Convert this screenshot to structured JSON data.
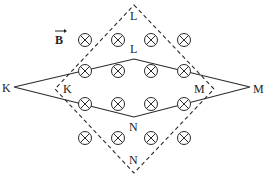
{
  "diagram": {
    "type": "physics-magnetic-field-loops",
    "field_label": "B",
    "field_direction": "into-page",
    "field_symbol": "⊗",
    "colors": {
      "line": "#2a2a2a",
      "background": "#ffffff"
    },
    "dashed_square": {
      "vertices": {
        "top": {
          "label": "L",
          "x": 134,
          "y": 5
        },
        "left": {
          "label": "K",
          "x": 55,
          "y": 89
        },
        "right": {
          "label": "M",
          "x": 214,
          "y": 89
        },
        "bottom": {
          "label": "N",
          "x": 134,
          "y": 173
        }
      }
    },
    "solid_rhombus": {
      "vertices": {
        "left": {
          "label": "K",
          "x": 14,
          "y": 87
        },
        "top": {
          "label": "L",
          "x": 134,
          "y": 59
        },
        "right": {
          "label": "M",
          "x": 250,
          "y": 87
        },
        "bottom": {
          "label": "N",
          "x": 134,
          "y": 117
        }
      }
    },
    "labels": {
      "outer_top": "L",
      "inner_top": "L",
      "outer_left": "K",
      "inner_left": "K",
      "outer_right": "M",
      "inner_right": "M",
      "inner_bottom": "N",
      "outer_bottom": "N",
      "field": "B"
    },
    "field_markers": [
      {
        "x": 85,
        "y": 40
      },
      {
        "x": 118,
        "y": 40
      },
      {
        "x": 151,
        "y": 40
      },
      {
        "x": 184,
        "y": 40
      },
      {
        "x": 85,
        "y": 71
      },
      {
        "x": 118,
        "y": 71
      },
      {
        "x": 151,
        "y": 71
      },
      {
        "x": 184,
        "y": 71
      },
      {
        "x": 85,
        "y": 104
      },
      {
        "x": 118,
        "y": 104
      },
      {
        "x": 151,
        "y": 104
      },
      {
        "x": 184,
        "y": 104
      },
      {
        "x": 85,
        "y": 138
      },
      {
        "x": 118,
        "y": 138
      },
      {
        "x": 151,
        "y": 138
      },
      {
        "x": 184,
        "y": 138
      }
    ]
  }
}
